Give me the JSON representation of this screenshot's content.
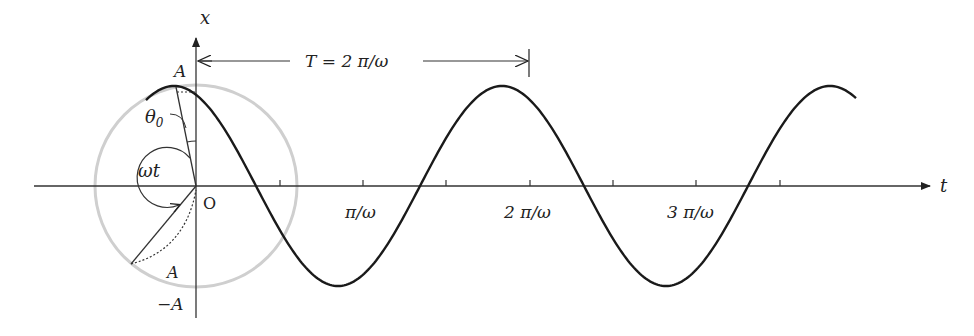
{
  "figure": {
    "type": "phasor-diagram-sinusoid",
    "colors": {
      "curve": "#1a1a1a",
      "axes": "#333333",
      "reference_circle": "#cfcfcf"
    }
  },
  "axes": {
    "vertical_label": "x",
    "horizontal_label": "t",
    "origin_label": "O",
    "amplitude_top_label": "A",
    "amplitude_bottom_label": "−A",
    "tick_labels": [
      "π/ω",
      "2 π/ω",
      "3 π/ω"
    ]
  },
  "annotations": {
    "period": "T = 2 π/ω",
    "initial_phase": "θ",
    "initial_phase_sub": "0",
    "rotation_angle": "ωt",
    "radius_label": "A"
  }
}
